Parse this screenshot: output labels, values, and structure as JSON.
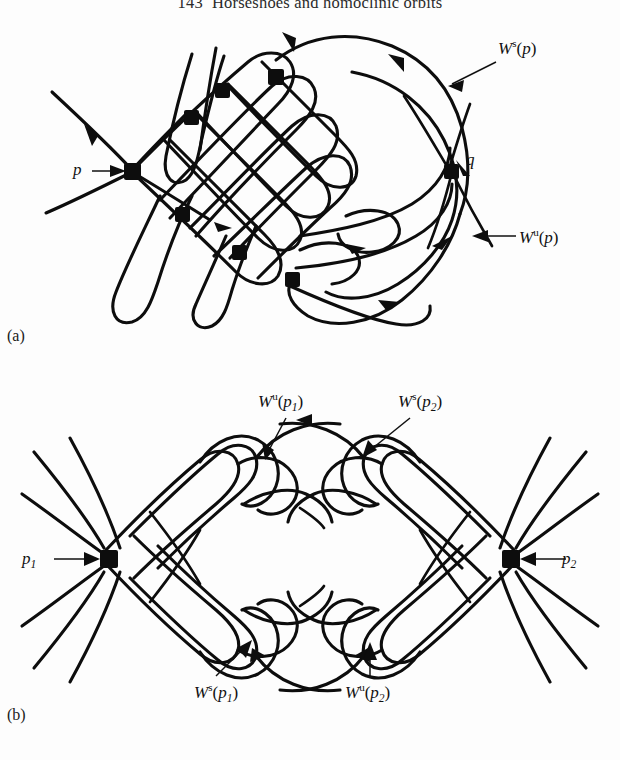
{
  "page": {
    "running_head": {
      "page_number": "143",
      "title": "Horseshoes and homoclinic orbits"
    },
    "background": "#ffffff",
    "ink_color": "#0d0d0d"
  },
  "figure": {
    "kind": "mathematical-diagram",
    "panels": [
      {
        "id": "a",
        "label": "(a)",
        "caption_labels": {
          "fixed_point": "p",
          "homoclinic_point": "q",
          "stable_manifold": {
            "W": "W",
            "sup": "s",
            "arg_open": "(",
            "arg": "p",
            "arg_close": ")"
          },
          "unstable_manifold": {
            "W": "W",
            "sup": "u",
            "arg_open": "(",
            "arg": "p",
            "arg_close": ")"
          }
        },
        "node_count": 6,
        "description": "A single saddle fixed point p whose stable and unstable manifolds intersect transversally producing a homoclinic tangle; q marks a homoclinic intersection point."
      },
      {
        "id": "b",
        "label": "(b)",
        "caption_labels": {
          "fixed_point_left": {
            "p": "p",
            "sub": "1"
          },
          "fixed_point_right": {
            "p": "p",
            "sub": "2"
          },
          "unstable_left": {
            "W": "W",
            "sup": "u",
            "arg_open": "(",
            "arg": "p",
            "sub": "1",
            "arg_close": ")"
          },
          "stable_right": {
            "W": "W",
            "sup": "s",
            "arg_open": "(",
            "arg": "p",
            "sub": "2",
            "arg_close": ")"
          },
          "stable_left": {
            "W": "W",
            "sup": "s",
            "arg_open": "(",
            "arg": "p",
            "sub": "1",
            "arg_close": ")"
          },
          "unstable_right": {
            "W": "W",
            "sup": "u",
            "arg_open": "(",
            "arg": "p",
            "sub": "2",
            "arg_close": ")"
          }
        },
        "node_count": 2,
        "description": "Two saddle fixed points p1 and p2 joined by a heteroclinic tangle; the unstable manifold of p1 weaves with the stable manifold of p2 above, and the stable manifold of p1 with the unstable manifold of p2 below."
      }
    ]
  }
}
